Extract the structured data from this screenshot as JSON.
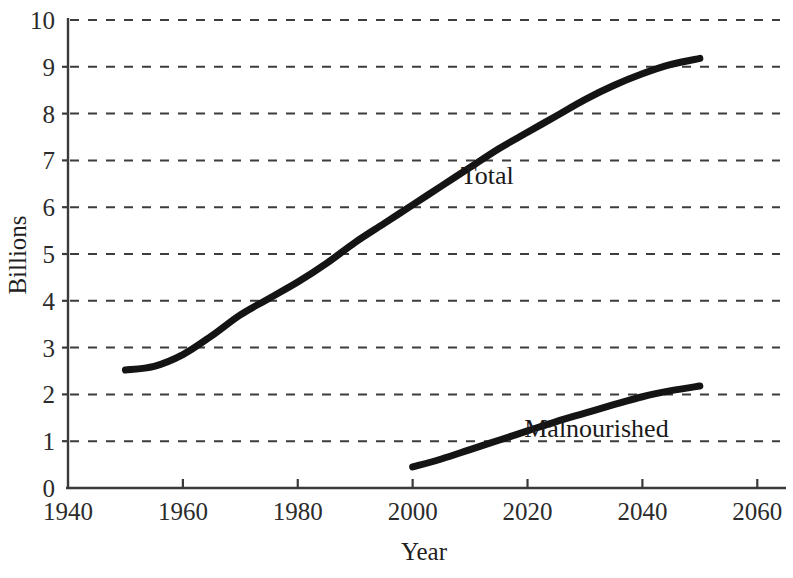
{
  "chart_data": {
    "type": "line",
    "title": "",
    "xlabel": "Year",
    "ylabel": "Billions",
    "xlim": [
      1940,
      2065
    ],
    "ylim": [
      0,
      10
    ],
    "grid": true,
    "grid_style": "dashed-horizontal",
    "legend_position": "inline-annotation",
    "x_ticks": [
      1940,
      1960,
      1980,
      2000,
      2020,
      2040,
      2060
    ],
    "x_tick_labels": [
      "1940",
      "1960",
      "1980",
      "2000",
      "2020",
      "2040",
      "2060"
    ],
    "y_ticks": [
      0,
      1,
      2,
      3,
      4,
      5,
      6,
      7,
      8,
      9,
      10
    ],
    "y_tick_labels": [
      "0",
      "1",
      "2",
      "3",
      "4",
      "5",
      "6",
      "7",
      "8",
      "9",
      "10"
    ],
    "line_color": "#141414",
    "line_width": 7,
    "series": [
      {
        "name": "Total",
        "label": "Total",
        "x": [
          1950,
          1955,
          1960,
          1965,
          1970,
          1975,
          1980,
          1985,
          1990,
          1995,
          2000,
          2005,
          2010,
          2015,
          2020,
          2025,
          2030,
          2035,
          2040,
          2045,
          2050
        ],
        "values": [
          2.52,
          2.6,
          2.85,
          3.25,
          3.7,
          4.05,
          4.4,
          4.8,
          5.25,
          5.65,
          6.05,
          6.45,
          6.85,
          7.25,
          7.6,
          7.95,
          8.3,
          8.6,
          8.85,
          9.05,
          9.18
        ]
      },
      {
        "name": "Malnourished",
        "label": "Malnourished",
        "x": [
          2000,
          2005,
          2010,
          2015,
          2020,
          2025,
          2030,
          2035,
          2040,
          2045,
          2050
        ],
        "values": [
          0.45,
          0.62,
          0.82,
          1.02,
          1.22,
          1.42,
          1.6,
          1.78,
          1.95,
          2.08,
          2.18
        ]
      }
    ],
    "annotations": [
      {
        "text": "Total",
        "x": 2013,
        "y": 6.5
      },
      {
        "text": "Malnourished",
        "x": 2032,
        "y": 1.1
      }
    ]
  }
}
